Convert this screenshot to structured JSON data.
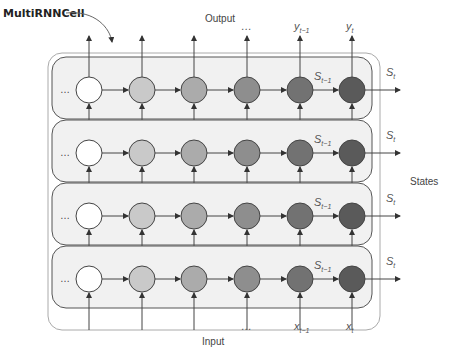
{
  "diagram": {
    "title": "MultiRNNCell",
    "output_label": "Output",
    "input_label": "Input",
    "states_label": "States",
    "ellipsis": "…",
    "outputs": [
      {
        "base": "…",
        "sub": ""
      },
      {
        "base": "y",
        "sub": "t−1"
      },
      {
        "base": "y",
        "sub": "t"
      }
    ],
    "inputs": [
      {
        "base": "…",
        "sub": ""
      },
      {
        "base": "x",
        "sub": "t−1"
      },
      {
        "base": "x",
        "sub": "t"
      }
    ],
    "state_prev": {
      "base": "S",
      "sub": "t−1"
    },
    "state_curr": {
      "base": "S",
      "sub": "t"
    },
    "layers": 4,
    "timesteps": 6,
    "cell_colors": [
      "#ffffff",
      "#c9c9c9",
      "#ababab",
      "#8e8e8e",
      "#727272",
      "#5a5a5a"
    ],
    "layer_fill": "#f1f1f1",
    "line_color": "#444444"
  }
}
